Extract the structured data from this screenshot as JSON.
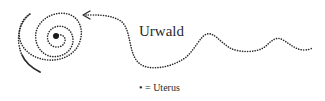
{
  "diagram": {
    "title": "Urwald",
    "legend": {
      "symbol": "•",
      "text": "• = Uterus"
    },
    "elements": [
      {
        "type": "spiral",
        "style": "dotted",
        "center_marker": "dot"
      },
      {
        "type": "wavy-line",
        "style": "dotted",
        "arrowhead": "points-to-spiral"
      },
      {
        "type": "tail-line",
        "style": "solid",
        "position": "spiral-outer-end"
      }
    ],
    "colors": {
      "ink": "#2a2a2a",
      "background": "#ffffff"
    }
  }
}
